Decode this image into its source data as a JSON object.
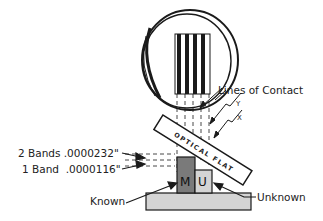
{
  "diagram": {
    "labels": {
      "lines_of_contact": "Lines of Contact",
      "y": "Y",
      "x": "X",
      "two_bands": "2 Bands .0000232\"",
      "one_band": "1 Band  .0000116\"",
      "known": "Known",
      "unknown": "Unknown",
      "optical_flat": "OPTICAL FLAT",
      "master_block": "M",
      "unknown_block": "U"
    },
    "colors": {
      "line": "#1a1a1a",
      "master_fill": "#7a7a7a",
      "unknown_fill": "#d4d4d4",
      "base_fill": "#d4d4d4",
      "background": "#ffffff"
    },
    "fringe_count": 4
  }
}
